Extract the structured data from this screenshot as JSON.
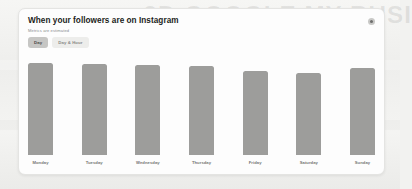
{
  "card": {
    "title": "When your followers are on Instagram",
    "subtitle": "Metrics are estimated",
    "info_icon": "info-circle-icon"
  },
  "toggle": {
    "options": [
      {
        "label": "Day",
        "selected": true
      },
      {
        "label": "Day & Hour",
        "selected": false
      }
    ]
  },
  "background": {
    "ghost_text": "3D GOOGLE MY BUSI"
  },
  "colors": {
    "bar": "#9d9d9b",
    "card_bg": "#fdfdfd",
    "page_bg": "#f2f2f0",
    "pill_selected": "#c6c6c4",
    "pill_unselected": "#ededeb",
    "title_text": "#1c1e21",
    "label_text": "#767674"
  },
  "chart_data": {
    "type": "bar",
    "title": "When your followers are on Instagram",
    "xlabel": "",
    "ylabel": "",
    "ylim": [
      0,
      100
    ],
    "grid": false,
    "legend": "none",
    "categories": [
      "Monday",
      "Tuesday",
      "Wednesday",
      "Thursday",
      "Friday",
      "Saturday",
      "Sunday"
    ],
    "values": [
      92,
      91,
      90,
      89,
      84,
      82,
      87
    ]
  }
}
